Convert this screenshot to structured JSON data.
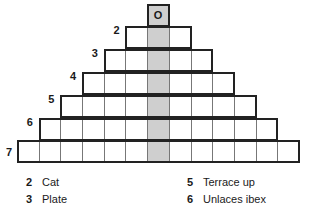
{
  "puzzle": {
    "type": "pyramid-word-grid",
    "top_letter": "O",
    "rows": [
      {
        "number": 1,
        "cells": 1,
        "label": ""
      },
      {
        "number": 2,
        "cells": 3,
        "label": "2"
      },
      {
        "number": 3,
        "cells": 5,
        "label": "3"
      },
      {
        "number": 4,
        "cells": 7,
        "label": "4"
      },
      {
        "number": 5,
        "cells": 9,
        "label": "5"
      },
      {
        "number": 6,
        "cells": 11,
        "label": "6"
      },
      {
        "number": 7,
        "cells": 13,
        "label": "7"
      }
    ],
    "shaded_column": "center",
    "colors": {
      "shaded": "#cfcfcf",
      "border": "#222222",
      "inner_line": "#777777"
    }
  },
  "clues": [
    {
      "number": "2",
      "text": "Cat"
    },
    {
      "number": "3",
      "text": "Plate"
    },
    {
      "number": "5",
      "text": "Terrace up"
    },
    {
      "number": "6",
      "text": "Unlaces ibex"
    }
  ]
}
